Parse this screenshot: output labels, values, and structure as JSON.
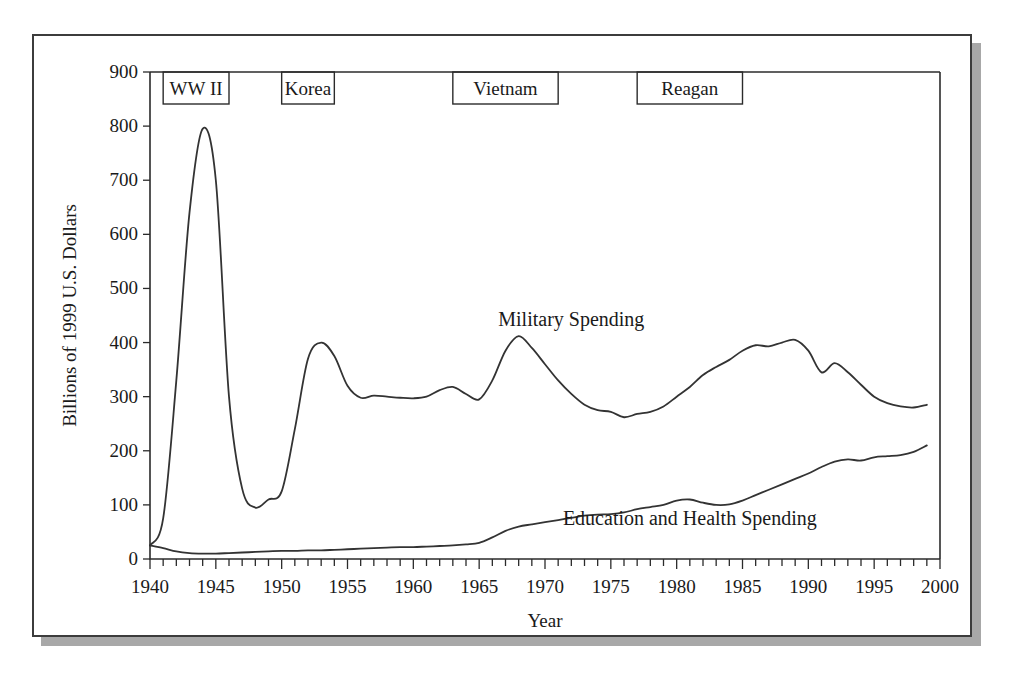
{
  "figure": {
    "frame_color": "#3c3c3c",
    "shadow_color": "#a8a8a8",
    "line_color": "#333333"
  },
  "chart_data": {
    "type": "line",
    "title": "",
    "xlabel": "Year",
    "ylabel": "Billions of 1999 U.S. Dollars",
    "xlim": [
      1940,
      2000
    ],
    "ylim": [
      0,
      900
    ],
    "grid": false,
    "legend_position": "inline-labels",
    "x_ticks": [
      1940,
      1945,
      1950,
      1955,
      1960,
      1965,
      1970,
      1975,
      1980,
      1985,
      1990,
      1995,
      2000
    ],
    "x_minor_tick_step": 1,
    "y_ticks": [
      0,
      100,
      200,
      300,
      400,
      500,
      600,
      700,
      800,
      900
    ],
    "annotations": [
      {
        "label": "WW II",
        "x_start": 1941,
        "x_end": 1946
      },
      {
        "label": "Korea",
        "x_start": 1950,
        "x_end": 1954
      },
      {
        "label": "Vietnam",
        "x_start": 1963,
        "x_end": 1971
      },
      {
        "label": "Reagan",
        "x_start": 1977,
        "x_end": 1985
      }
    ],
    "x": [
      1940,
      1941,
      1942,
      1943,
      1944,
      1945,
      1946,
      1947,
      1948,
      1949,
      1950,
      1951,
      1952,
      1953,
      1954,
      1955,
      1956,
      1957,
      1958,
      1959,
      1960,
      1961,
      1962,
      1963,
      1964,
      1965,
      1966,
      1967,
      1968,
      1969,
      1970,
      1971,
      1972,
      1973,
      1974,
      1975,
      1976,
      1977,
      1978,
      1979,
      1980,
      1981,
      1982,
      1983,
      1984,
      1985,
      1986,
      1987,
      1988,
      1989,
      1990,
      1991,
      1992,
      1993,
      1994,
      1995,
      1996,
      1997,
      1998,
      1999
    ],
    "series": [
      {
        "name": "Military Spending",
        "label_x": 1972,
        "label_y": 430,
        "values": [
          25,
          75,
          330,
          640,
          795,
          700,
          300,
          130,
          95,
          110,
          125,
          240,
          370,
          400,
          375,
          320,
          298,
          302,
          300,
          298,
          297,
          300,
          312,
          318,
          305,
          295,
          330,
          385,
          412,
          390,
          360,
          330,
          305,
          285,
          275,
          272,
          262,
          268,
          272,
          282,
          300,
          318,
          340,
          355,
          368,
          385,
          395,
          393,
          400,
          405,
          385,
          345,
          362,
          345,
          322,
          300,
          288,
          282,
          280,
          285
        ]
      },
      {
        "name": "Education and Health Spending",
        "label_x": 1981,
        "label_y": 62,
        "values": [
          25,
          20,
          14,
          11,
          10,
          10,
          11,
          12,
          13,
          14,
          15,
          15,
          16,
          16,
          17,
          18,
          19,
          20,
          21,
          22,
          22,
          23,
          24,
          25,
          27,
          30,
          40,
          52,
          60,
          64,
          68,
          72,
          76,
          80,
          82,
          83,
          86,
          92,
          96,
          100,
          108,
          110,
          104,
          100,
          101,
          108,
          118,
          128,
          138,
          148,
          158,
          170,
          180,
          184,
          182,
          188,
          190,
          192,
          198,
          210
        ]
      }
    ]
  }
}
